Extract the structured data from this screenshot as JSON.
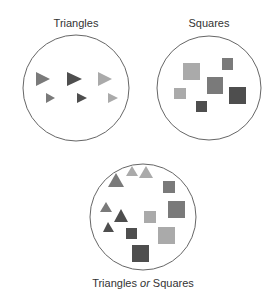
{
  "sets": [
    {
      "label": "Triangles"
    },
    {
      "label": "Squares"
    },
    {
      "label_pre": "Triangles ",
      "label_em": "or",
      "label_post": " Squares"
    }
  ],
  "colors": {
    "light": "#aaaaaa",
    "mid": "#7a7a7a",
    "dark": "#4e4e4e",
    "outline": "#666666"
  }
}
